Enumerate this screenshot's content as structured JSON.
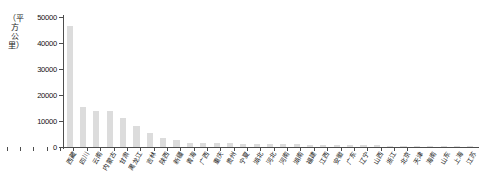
{
  "chart_data": {
    "type": "bar",
    "title": "",
    "xlabel": "",
    "ylabel": "（平方公里）",
    "ylim": [
      0,
      50000
    ],
    "ytick_values": [
      0,
      10000,
      20000,
      30000,
      40000,
      50000
    ],
    "ytick_labels": [
      "0",
      "10000",
      "20000",
      "30000",
      "40000",
      "50000"
    ],
    "grid": false,
    "legend": false,
    "bar_color": "#dcdcdc",
    "axis_color": "#4d4d4d",
    "categories": [
      "西藏",
      "四川",
      "云南",
      "内蒙古",
      "甘肃",
      "黑龙江",
      "吉林",
      "陕西",
      "新疆",
      "青海",
      "广西",
      "重庆",
      "贵州",
      "宁夏",
      "湖北",
      "河北",
      "河南",
      "湖南",
      "福建",
      "江西",
      "安徽",
      "广东",
      "辽宁",
      "山西",
      "浙江",
      "北京",
      "天津",
      "海南",
      "山东",
      "上海",
      "江苏"
    ],
    "values": [
      46500,
      15500,
      14000,
      13800,
      11200,
      8200,
      5300,
      3400,
      2700,
      1700,
      1550,
      1500,
      1450,
      1350,
      1300,
      1200,
      1100,
      1000,
      950,
      900,
      820,
      760,
      700,
      640,
      560,
      480,
      400,
      330,
      260,
      180,
      120
    ]
  }
}
